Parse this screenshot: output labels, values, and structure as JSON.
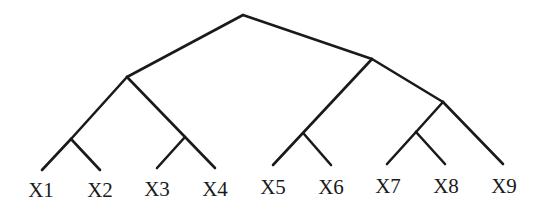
{
  "diagram": {
    "type": "tree",
    "title": "",
    "stroke_color": "#1a1a1a",
    "background": "#ffffff",
    "nodes": {
      "root": {
        "x": 243,
        "y": 15
      },
      "n_left": {
        "x": 127,
        "y": 77
      },
      "n_right": {
        "x": 372,
        "y": 59
      },
      "n_12": {
        "x": 71,
        "y": 139
      },
      "n_34": {
        "x": 185,
        "y": 137
      },
      "n_56": {
        "x": 304,
        "y": 134
      },
      "n_789": {
        "x": 443,
        "y": 102
      },
      "n_78": {
        "x": 416,
        "y": 132
      },
      "X1": {
        "x": 42,
        "y": 170
      },
      "X2": {
        "x": 100,
        "y": 170
      },
      "X3": {
        "x": 157,
        "y": 168
      },
      "X4": {
        "x": 215,
        "y": 168
      },
      "X5": {
        "x": 273,
        "y": 165
      },
      "X6": {
        "x": 331,
        "y": 165
      },
      "X7": {
        "x": 387,
        "y": 164
      },
      "X8": {
        "x": 445,
        "y": 164
      },
      "X9": {
        "x": 503,
        "y": 164
      }
    },
    "edges": [
      [
        "root",
        "n_left"
      ],
      [
        "root",
        "n_right"
      ],
      [
        "n_left",
        "n_12"
      ],
      [
        "n_left",
        "X4"
      ],
      [
        "n_12",
        "X1"
      ],
      [
        "n_12",
        "X2"
      ],
      [
        "n_34",
        "X3"
      ],
      [
        "n_right",
        "X5"
      ],
      [
        "n_right",
        "n_789"
      ],
      [
        "n_56",
        "X6"
      ],
      [
        "n_789",
        "n_78"
      ],
      [
        "n_789",
        "X9"
      ],
      [
        "n_78",
        "X7"
      ],
      [
        "n_78",
        "X8"
      ]
    ],
    "leaves": [
      {
        "id": "X1",
        "label": "X1",
        "label_x": 41,
        "label_y": 197
      },
      {
        "id": "X2",
        "label": "X2",
        "label_x": 100,
        "label_y": 197
      },
      {
        "id": "X3",
        "label": "X3",
        "label_x": 157,
        "label_y": 196
      },
      {
        "id": "X4",
        "label": "X4",
        "label_x": 215,
        "label_y": 196
      },
      {
        "id": "X5",
        "label": "X5",
        "label_x": 273,
        "label_y": 194
      },
      {
        "id": "X6",
        "label": "X6",
        "label_x": 331,
        "label_y": 194
      },
      {
        "id": "X7",
        "label": "X7",
        "label_x": 388,
        "label_y": 193
      },
      {
        "id": "X8",
        "label": "X8",
        "label_x": 446,
        "label_y": 193
      },
      {
        "id": "X9",
        "label": "X9",
        "label_x": 504,
        "label_y": 193
      }
    ]
  }
}
